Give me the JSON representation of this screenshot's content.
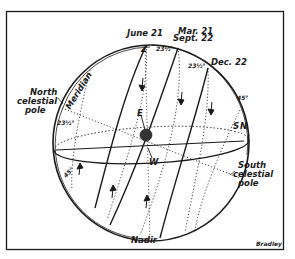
{
  "diagram": {
    "labels": {
      "june": "June 21",
      "march": "Mar. 21",
      "sept": "Sept. 22",
      "dec": "Dec. 22",
      "zenith": "Z",
      "east": "E",
      "west": "W",
      "south_point": "S",
      "north_point": "N",
      "nadir": "Nadir",
      "meridian": "Meridian",
      "north_pole_1": "North",
      "north_pole_2": "celestial",
      "north_pole_3": "pole",
      "south_pole_1": "South",
      "south_pole_2": "celestial",
      "south_pole_3": "pole",
      "angle_a": "23½°",
      "angle_b": "23½°",
      "angle_c": "23½°",
      "angle_45_right": "45°",
      "angle_45_left": "45°",
      "credit": "Bradley"
    },
    "colors": {
      "ink": "#1a1a1a",
      "paper": "#ffffff",
      "earth": "#333333"
    }
  }
}
